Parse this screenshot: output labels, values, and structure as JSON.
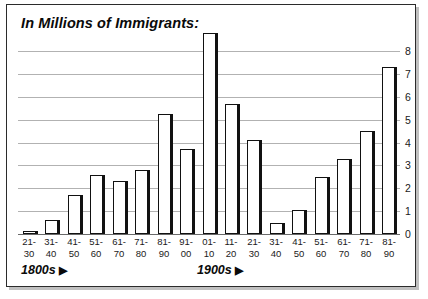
{
  "chart_title": "In Millions of Immigrants:",
  "footer": {
    "era_1800_label": "1800s",
    "era_1900_label": "1900s",
    "arrow_glyph": "▶"
  },
  "colors": {
    "frame_border": "#2b2b2b",
    "bar_fill": "#ffffff",
    "bar_outline": "#111111",
    "gridline": "#b2b2b2",
    "text": "#1a1a1a"
  },
  "chart_data": {
    "type": "bar",
    "title": "In Millions of Immigrants:",
    "xlabel": "",
    "ylabel": "",
    "ylim": [
      0,
      8
    ],
    "yticks": [
      0,
      1,
      2,
      3,
      4,
      5,
      6,
      7,
      8
    ],
    "ytick_labels": [
      "0",
      "1",
      "2",
      "3",
      "4",
      "5",
      "6",
      "7",
      "8"
    ],
    "grid": true,
    "legend": false,
    "categories": [
      "21-30",
      "31-40",
      "41-50",
      "51-60",
      "61-70",
      "71-80",
      "81-90",
      "91-00",
      "01-10",
      "11-20",
      "21-30",
      "31-40",
      "41-50",
      "51-60",
      "61-70",
      "71-80",
      "81-90"
    ],
    "category_lines": [
      [
        "21-",
        "30"
      ],
      [
        "31-",
        "40"
      ],
      [
        "41-",
        "50"
      ],
      [
        "51-",
        "60"
      ],
      [
        "61-",
        "70"
      ],
      [
        "71-",
        "80"
      ],
      [
        "81-",
        "90"
      ],
      [
        "91-",
        "00"
      ],
      [
        "01-",
        "10"
      ],
      [
        "11-",
        "20"
      ],
      [
        "21-",
        "30"
      ],
      [
        "31-",
        "40"
      ],
      [
        "41-",
        "50"
      ],
      [
        "51-",
        "60"
      ],
      [
        "61-",
        "70"
      ],
      [
        "71-",
        "80"
      ],
      [
        "81-",
        "90"
      ]
    ],
    "values": [
      0.15,
      0.6,
      1.7,
      2.6,
      2.3,
      2.8,
      5.25,
      3.7,
      8.8,
      5.7,
      4.1,
      0.5,
      1.05,
      2.5,
      3.3,
      4.5,
      7.3
    ],
    "era_groups": [
      {
        "label": "1800s",
        "start_index": 0,
        "end_index": 7
      },
      {
        "label": "1900s",
        "start_index": 8,
        "end_index": 16
      }
    ]
  }
}
